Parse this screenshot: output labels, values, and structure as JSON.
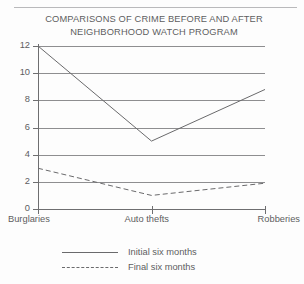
{
  "chart_data": {
    "type": "line",
    "title": "COMPARISONS OF CRIME BEFORE AND AFTER\nNEIGHBORHOOD WATCH PROGRAM",
    "title_line_1": "COMPARISONS OF CRIME BEFORE AND AFTER",
    "title_line_2": "NEIGHBORHOOD WATCH PROGRAM",
    "xlabel": "",
    "ylabel": "",
    "categories": [
      "Burglaries",
      "Auto thefts",
      "Robberies"
    ],
    "series": [
      {
        "name": "Initial six months",
        "style": "solid",
        "color": "#6a6a6c",
        "values": [
          12.0,
          5.0,
          8.8
        ]
      },
      {
        "name": "Final six months",
        "style": "dashed",
        "color": "#6a6a6c",
        "values": [
          3.0,
          1.0,
          1.9
        ]
      }
    ],
    "ylim": [
      0,
      12
    ],
    "ytick_labels": [
      "12",
      "10",
      "8",
      "6",
      "4",
      "2",
      "0"
    ],
    "ytick_values": [
      12,
      10,
      8,
      6,
      4,
      2,
      0
    ],
    "grid": "horizontal",
    "legend_position": "below-plot-left"
  },
  "legend": {
    "entries": [
      {
        "label": "Initial six months",
        "style": "solid"
      },
      {
        "label": "Final six months",
        "style": "dashed"
      }
    ]
  }
}
